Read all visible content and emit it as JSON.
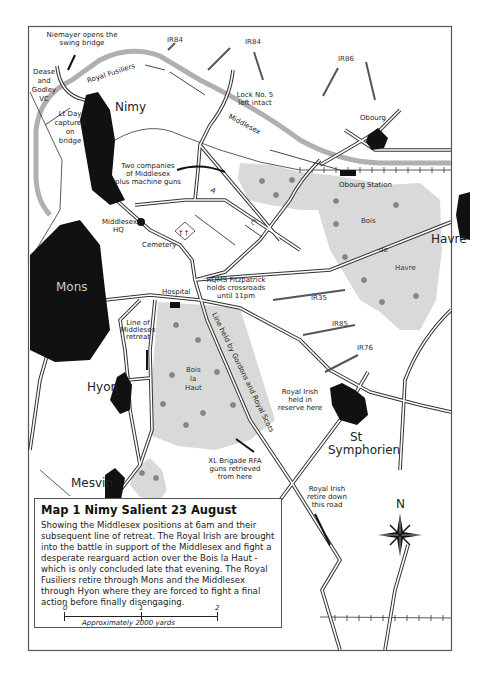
{
  "map": {
    "title": "Map 1 Nimy Salient 23 August",
    "description": "Showing the Middlesex positions at 6am and their subsequent line of retreat. The Royal Irish are brought into the battle in support of the Middlesex and fight a desperate rearguard action over the Bois la Haut - which is only concluded late that evening. The Royal Fusiliers retire through Mons and the Middlesex through Hyon where they are forced to fight a final action before finally disengaging.",
    "scale": {
      "ticks": [
        "0",
        "1",
        "2"
      ],
      "caption": "Approximately 2000 yards"
    },
    "compass": {
      "label": "N"
    },
    "colors": {
      "town": "#111111",
      "wood": "#d9d9d9",
      "canal": "#a9a9a9",
      "frame": "#555555"
    }
  },
  "places": {
    "nimy": "Nimy",
    "mons": "Mons",
    "obourg": "Obourg",
    "obourg_station": "Obourg Station",
    "havre": "Havre",
    "hyon": "Hyon",
    "mesvin": "Mesvin",
    "st": "St",
    "symphorien": "Symphorien",
    "cemetery": "Cemetery",
    "hospital": "Hospital",
    "middlesex_hq_1": "Middlesex",
    "middlesex_hq_2": "HQ"
  },
  "woods": {
    "bois_de_havre": [
      "Bois",
      "de",
      "Havre"
    ],
    "bois_la_haut": [
      "Bois",
      "la",
      "Haut"
    ]
  },
  "units": {
    "royal_fusiliers": "Royal Fusiliers",
    "middlesex": "Middlesex",
    "positions": [
      "A",
      "C"
    ]
  },
  "german_regiments": [
    "IR84",
    "IR84",
    "IR86",
    "IR35",
    "IR85",
    "IR76"
  ],
  "annotations": {
    "niemayer": [
      "Niemayer opens the",
      "swing bridge"
    ],
    "dease": [
      "Dease",
      "and",
      "Godley",
      "VC"
    ],
    "lt_day": [
      "Lt Day",
      "captured",
      "on",
      "bridge"
    ],
    "lock5": [
      "Lock No. 5",
      "left intact"
    ],
    "two_companies": [
      "Two companies",
      "of Middlesex",
      "plus machine guns"
    ],
    "rqms": [
      "RQMS Fitzpatrick",
      "holds crossroads",
      "until 11pm"
    ],
    "line_retreat": [
      "Line of",
      "Middlesex",
      "retreat"
    ],
    "line_held": "Line held by Gordons and Royal Scots",
    "royal_irish_reserve": [
      "Royal Irish",
      "held in",
      "reserve here"
    ],
    "xl_brigade": [
      "XL Brigade RFA",
      "guns retrieved",
      "from here"
    ],
    "royal_irish_retire": [
      "Royal Irish",
      "retire down",
      "this road"
    ]
  }
}
